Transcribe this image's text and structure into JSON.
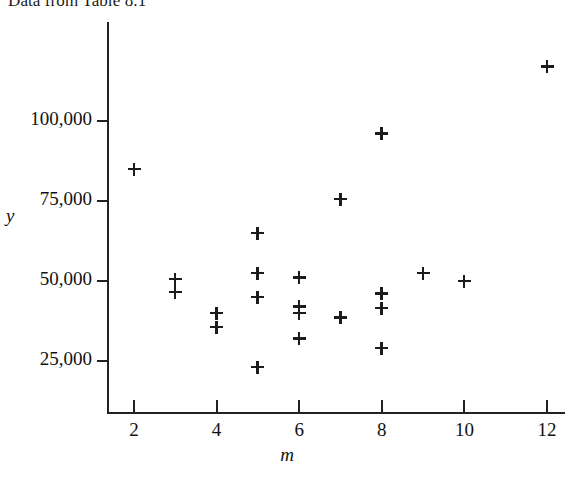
{
  "title": "Data from Table 8.1",
  "axes": {
    "y_name": "y",
    "x_name": "m",
    "y_ticks": [
      {
        "label": "100,000",
        "value": 100000
      },
      {
        "label": "75,000",
        "value": 75000
      },
      {
        "label": "50,000",
        "value": 50000
      },
      {
        "label": "25,000",
        "value": 25000
      }
    ],
    "x_ticks": [
      {
        "label": "2",
        "value": 2
      },
      {
        "label": "4",
        "value": 4
      },
      {
        "label": "6",
        "value": 6
      },
      {
        "label": "8",
        "value": 8
      },
      {
        "label": "10",
        "value": 10
      },
      {
        "label": "12",
        "value": 12
      }
    ]
  },
  "style": {
    "marker_color": "#1c1c1c",
    "axis_color": "#222222",
    "background": "#ffffff",
    "marker_symbol": "plus"
  },
  "chart_data": {
    "type": "scatter",
    "title": "Data from Table 8.1",
    "xlabel": "m",
    "ylabel": "y",
    "grid": false,
    "legend": "none",
    "marker": "+",
    "xlim": [
      1.2,
      12.6
    ],
    "ylim": [
      18000,
      122000
    ],
    "x": [
      2,
      3,
      3,
      4,
      4,
      5,
      5,
      5,
      5,
      6,
      6,
      6,
      6,
      7,
      7,
      8,
      8,
      8,
      8,
      9,
      10,
      12
    ],
    "y": [
      85000,
      50500,
      46500,
      40000,
      35500,
      65000,
      52500,
      45000,
      23000,
      51000,
      42000,
      40000,
      32000,
      75500,
      38500,
      96000,
      46000,
      41500,
      29000,
      52500,
      50000,
      117000
    ],
    "points": [
      {
        "m": 2,
        "y": 85000
      },
      {
        "m": 3,
        "y": 50500
      },
      {
        "m": 3,
        "y": 46500
      },
      {
        "m": 4,
        "y": 40000
      },
      {
        "m": 4,
        "y": 35500
      },
      {
        "m": 5,
        "y": 65000
      },
      {
        "m": 5,
        "y": 52500
      },
      {
        "m": 5,
        "y": 45000
      },
      {
        "m": 5,
        "y": 23000
      },
      {
        "m": 6,
        "y": 51000
      },
      {
        "m": 6,
        "y": 42000
      },
      {
        "m": 6,
        "y": 40000
      },
      {
        "m": 6,
        "y": 32000
      },
      {
        "m": 7,
        "y": 75500
      },
      {
        "m": 7,
        "y": 38500
      },
      {
        "m": 8,
        "y": 96000
      },
      {
        "m": 8,
        "y": 46000
      },
      {
        "m": 8,
        "y": 41500
      },
      {
        "m": 8,
        "y": 29000
      },
      {
        "m": 9,
        "y": 52500
      },
      {
        "m": 10,
        "y": 50000
      },
      {
        "m": 12,
        "y": 117000
      }
    ]
  }
}
